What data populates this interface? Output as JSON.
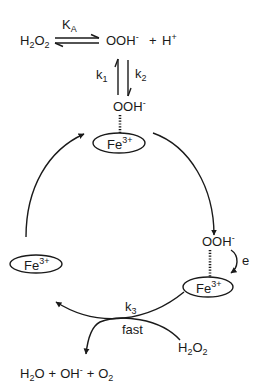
{
  "equilibrium": {
    "reactant": "H2O2",
    "reactant_main1": "H",
    "reactant_sub1": "2",
    "reactant_main2": "O",
    "reactant_sub2": "2",
    "constant_main": "K",
    "constant_sub": "A",
    "product1_main": "OOH",
    "product1_sup": "-",
    "plus": "+",
    "product2_main": "H",
    "product2_sup": "+"
  },
  "binding": {
    "k1_main": "k",
    "k1_sub": "1",
    "k2_main": "k",
    "k2_sub": "2"
  },
  "top_complex": {
    "ligand_main": "OOH",
    "ligand_sup": "-",
    "metal_main": "Fe",
    "metal_sup": "3+"
  },
  "right_complex": {
    "ligand_main": "OOH",
    "ligand_sup": "-",
    "electron_label": "e",
    "metal_main": "Fe",
    "metal_sup": "3+"
  },
  "left_complex": {
    "metal_main": "Fe",
    "metal_sup": "3+"
  },
  "decomposition": {
    "k3_main": "k",
    "k3_sub": "3",
    "rate_label": "fast",
    "reagent_main1": "H",
    "reagent_sub1": "2",
    "reagent_main2": "O",
    "reagent_sub2": "2",
    "products": {
      "p1_main1": "H",
      "p1_sub": "2",
      "p1_main2": "O",
      "plus1": "+",
      "p2_main": "OH",
      "p2_sup": "-",
      "plus2": "+",
      "p3_main": "O",
      "p3_sub": "2"
    }
  }
}
